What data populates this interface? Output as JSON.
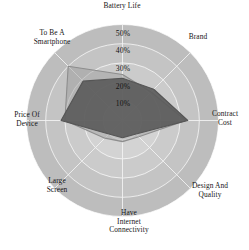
{
  "chart_data": {
    "type": "radar",
    "title": "",
    "xlabel": "",
    "ylabel": "",
    "grid": true,
    "legend_position": "none",
    "rlim": [
      0,
      50
    ],
    "r_tick_suffix": "%",
    "r_ticks": [
      10,
      20,
      30,
      40,
      50
    ],
    "r_tick_labels": [
      "10%",
      "20%",
      "30%",
      "40%",
      "50%"
    ],
    "categories": [
      "Battery Life",
      "Brand",
      "Contract Cost",
      "Design And Quality",
      "Have Internet Connectivity",
      "Large Screen",
      "Price Of Device",
      "To Be A Smartphone"
    ],
    "category_label_lines": [
      [
        "Battery Life"
      ],
      [
        "Brand"
      ],
      [
        "Contract",
        "Cost"
      ],
      [
        "Design And",
        "Quality"
      ],
      [
        "Have",
        "Internet",
        "Connectivity"
      ],
      [
        "Large",
        "Screen"
      ],
      [
        "Price Of",
        "Device"
      ],
      [
        "To Be A",
        "Smartphone"
      ]
    ],
    "series": [
      {
        "name": "Series 1",
        "color": "#555555",
        "fill": "#5a5a5a",
        "fill_opacity": 0.9,
        "values": [
          22,
          23,
          34,
          10,
          9,
          10,
          32,
          29
        ]
      },
      {
        "name": "Series 2",
        "color": "#8d8d8d",
        "fill": "#9a9a9a",
        "fill_opacity": 0.45,
        "values": [
          24,
          21,
          33,
          12,
          11,
          13,
          30,
          40
        ]
      }
    ]
  },
  "ticks": {
    "t10": "10%",
    "t20": "20%",
    "t30": "30%",
    "t40": "40%",
    "t50": "50%"
  },
  "labels": {
    "battery_life": "Battery Life",
    "brand": "Brand",
    "contract_cost": "Contract\nCost",
    "design_and_quality": "Design And\nQuality",
    "internet_connectivity": "Have\nInternet\nConnectivity",
    "large_screen": "Large\nScreen",
    "price_of_device": "Price Of\nDevice",
    "to_be_a_smartphone": "To Be A\nSmartphone"
  },
  "colors": {
    "ring_outer": "#dcdcdc",
    "ring_inner": "#cfcfcf",
    "spoke": "#f2f2f2",
    "series1": "#5a5a5a",
    "series2": "#9a9a9a",
    "background": "#ffffff"
  }
}
